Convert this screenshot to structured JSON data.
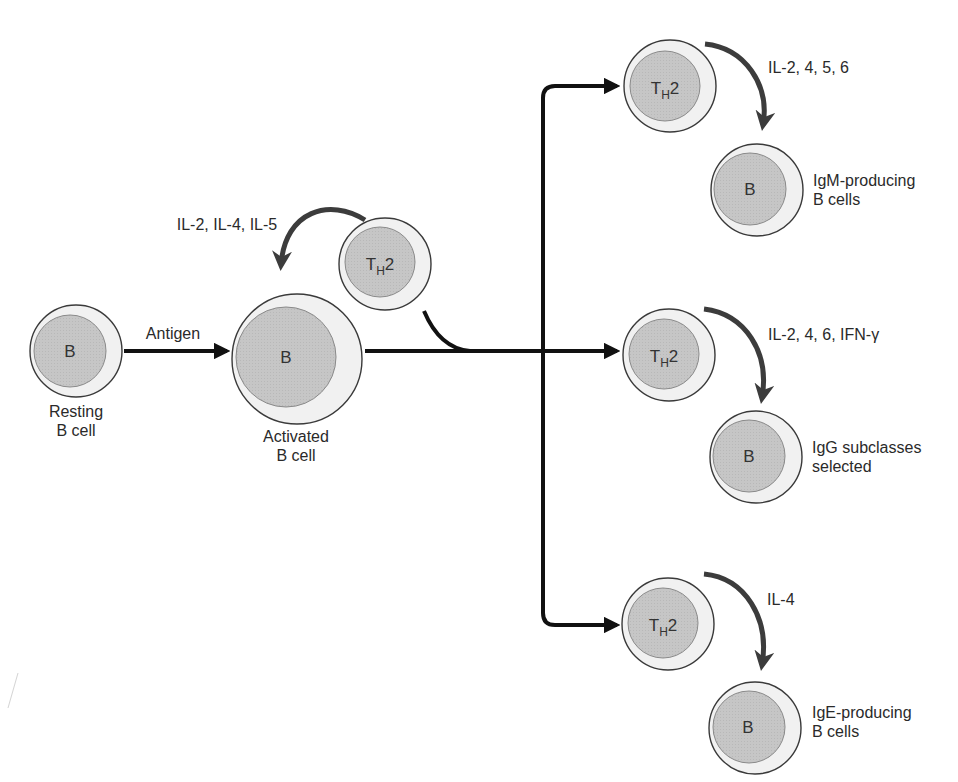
{
  "diagram": {
    "colors": {
      "cell_outer_fill": "#f0f0f0",
      "cell_inner_fill": "#c4c4c4",
      "cell_outline": "#3a3a3a",
      "arrow_black": "#111111",
      "cytokine_arrow": "#3c3c3c"
    },
    "left": {
      "resting_cell": {
        "letter": "B",
        "label_line1": "Resting",
        "label_line2": "B cell"
      },
      "antigen_label": "Antigen",
      "activated_cell": {
        "letter": "B",
        "label_line1": "Activated",
        "label_line2": "B cell"
      },
      "helper_cell": {
        "main": "T",
        "sub": "H",
        "suffix": "2"
      },
      "helper_cytokines": "IL-2, IL-4, IL-5"
    },
    "branches": [
      {
        "th": {
          "main": "T",
          "sub": "H",
          "suffix": "2"
        },
        "cytokines": "IL-2, 4, 5, 6",
        "b_cell": {
          "letter": "B",
          "label_line1": "IgM-producing",
          "label_line2": "B cells"
        }
      },
      {
        "th": {
          "main": "T",
          "sub": "H",
          "suffix": "2"
        },
        "cytokines": "IL-2, 4, 6, IFN-γ",
        "b_cell": {
          "letter": "B",
          "label_line1": "IgG subclasses",
          "label_line2": "selected"
        }
      },
      {
        "th": {
          "main": "T",
          "sub": "H",
          "suffix": "2"
        },
        "cytokines": "IL-4",
        "b_cell": {
          "letter": "B",
          "label_line1": "IgE-producing",
          "label_line2": "B cells"
        }
      }
    ]
  }
}
